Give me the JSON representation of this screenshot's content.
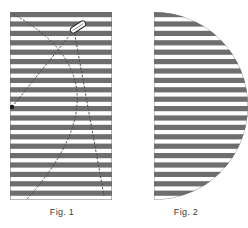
{
  "figure": {
    "panels": [
      {
        "id": "fig1",
        "caption": "Fig. 1",
        "shape": "striped-rectangle",
        "description": "Rectangle filled with horizontal stripes, overlaid by a dashed circular arc and a dashed straight chord meeting at a small needle shape"
      },
      {
        "id": "fig2",
        "caption": "Fig. 2",
        "shape": "striped-half-disc",
        "description": "Half disc with flat left edge and curved right edge, filled with horizontal stripes"
      }
    ]
  },
  "chart_data": {
    "type": "diagram",
    "title": "",
    "panels": [
      {
        "label": "Fig. 1",
        "geometry": "rectangle",
        "x": 10,
        "y": 12,
        "width": 102,
        "height": 188,
        "stripe_count": 20,
        "stripe_period": 9.4,
        "stripe_thickness": 5.2,
        "overlays": [
          {
            "kind": "arc",
            "style": "dashed",
            "start": [
              13,
              14
            ],
            "control": [
              134,
              80
            ],
            "end": [
              27,
              199
            ]
          },
          {
            "kind": "line",
            "style": "dashed",
            "start": [
              12,
              107
            ],
            "end": [
              74,
              30
            ]
          },
          {
            "kind": "line",
            "style": "dashed",
            "start": [
              74,
              30
            ],
            "end": [
              104,
              196
            ]
          },
          {
            "kind": "dot",
            "center": [
              12,
              107
            ],
            "radius": 2.2
          },
          {
            "kind": "needle",
            "center": [
              78,
              27
            ],
            "length": 17,
            "width": 6,
            "angle_deg": -33
          }
        ]
      },
      {
        "label": "Fig. 2",
        "geometry": "half-disc",
        "flat_edge_x": 154,
        "top": 12,
        "bottom": 200,
        "radius": 94,
        "stripe_count": 20,
        "stripe_period": 9.4,
        "stripe_thickness": 5.2
      }
    ],
    "colors": {
      "stripe": "#6e6e6e",
      "background": "#ffffff",
      "outline": "#4a4a4a",
      "caption": "#3a3a3a"
    }
  }
}
